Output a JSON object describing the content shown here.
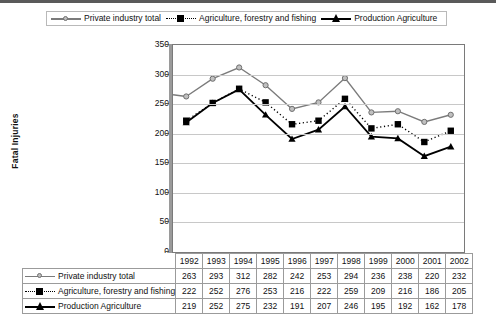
{
  "chart_data": {
    "type": "line",
    "title": "",
    "xlabel": "",
    "ylabel": "Fatal Injuries",
    "ylim": [
      0,
      350
    ],
    "yticks": [
      0,
      50,
      100,
      150,
      200,
      250,
      300,
      350
    ],
    "grid": true,
    "legend_position": "top",
    "categories": [
      "1992",
      "1993",
      "1994",
      "1995",
      "1996",
      "1997",
      "1998",
      "1999",
      "2000",
      "2001",
      "2002"
    ],
    "series": [
      {
        "name": "Private industry total",
        "marker": "circle",
        "line_style": "solid",
        "color": "#7b7b7b",
        "values": [
          263,
          293,
          312,
          282,
          242,
          253,
          294,
          236,
          238,
          220,
          232
        ]
      },
      {
        "name": "Agriculture, forestry and fishing",
        "marker": "square",
        "line_style": "dotted",
        "color": "#000000",
        "values": [
          222,
          252,
          276,
          253,
          216,
          222,
          259,
          209,
          216,
          186,
          205
        ]
      },
      {
        "name": "Production Agriculture",
        "marker": "triangle",
        "line_style": "solid",
        "color": "#000000",
        "values": [
          219,
          252,
          275,
          232,
          191,
          207,
          246,
          195,
          192,
          162,
          178
        ]
      }
    ]
  },
  "legend": {
    "items": [
      {
        "label": "Private industry total",
        "key": "circle-gray-solid-line-icon"
      },
      {
        "label": "Agriculture, forestry and fishing",
        "key": "square-black-dotted-line-icon"
      },
      {
        "label": "Production Agriculture",
        "key": "triangle-black-solid-line-icon"
      }
    ]
  },
  "table": {
    "year_header": [
      "1992",
      "1993",
      "1994",
      "1995",
      "1996",
      "1997",
      "1998",
      "1999",
      "2000",
      "2001",
      "2002"
    ],
    "rows": [
      {
        "label": "Private industry total",
        "values": [
          "263",
          "293",
          "312",
          "282",
          "242",
          "253",
          "294",
          "236",
          "238",
          "220",
          "232"
        ]
      },
      {
        "label": "Agriculture, forestry and fishing",
        "values": [
          "222",
          "252",
          "276",
          "253",
          "216",
          "222",
          "259",
          "209",
          "216",
          "186",
          "205"
        ]
      },
      {
        "label": "Production Agriculture",
        "values": [
          "219",
          "252",
          "275",
          "232",
          "191",
          "207",
          "246",
          "195",
          "192",
          "162",
          "178"
        ]
      }
    ]
  },
  "axis": {
    "y_title": "Fatal Injuries",
    "y_ticks": [
      "350",
      "300",
      "250",
      "200",
      "150",
      "100",
      "50",
      "0"
    ]
  },
  "colors": {
    "series1": "#7b7b7b",
    "series2": "#000000",
    "series3": "#000000",
    "grid": "#c8c8c8",
    "border": "#7a7a7a"
  }
}
